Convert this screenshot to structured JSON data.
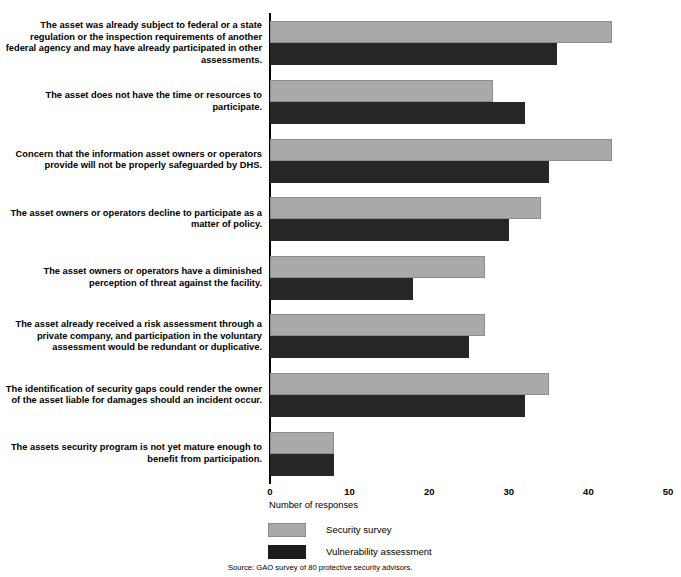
{
  "chart_data": {
    "type": "bar",
    "orientation": "horizontal",
    "title": "",
    "xlabel": "Number of responses",
    "ylabel": "",
    "xlim": [
      0,
      50
    ],
    "xticks": [
      0,
      10,
      20,
      30,
      40,
      50
    ],
    "grid": false,
    "legend_position": "bottom-left",
    "categories": [
      "The asset was already subject to federal or a state regulation or the inspection requirements of another federal agency and may have already participated in other assessments.",
      "The asset does not have the time or resources to participate.",
      "Concern that the information asset owners or operators provide will not be properly safeguarded by DHS.",
      "The asset owners or operators decline to participate as a matter of policy.",
      "The asset owners or operators have a diminished perception of threat against the facility.",
      "The asset already received a risk assessment through a private company, and participation in the voluntary assessment would be redundant or duplicative.",
      "The identification of security gaps could render the owner of the asset liable for damages should an incident occur.",
      "The assets security program is not yet mature enough to benefit from participation."
    ],
    "series": [
      {
        "name": "Security survey",
        "color": "#a9a9a9",
        "values": [
          43,
          28,
          43,
          34,
          27,
          27,
          35,
          8
        ]
      },
      {
        "name": "Vulnerability assessment",
        "color": "#262626",
        "values": [
          36,
          32,
          35,
          30,
          18,
          25,
          32,
          8
        ]
      }
    ],
    "source": "Source: GAO survey of 80 protective security advisors."
  }
}
